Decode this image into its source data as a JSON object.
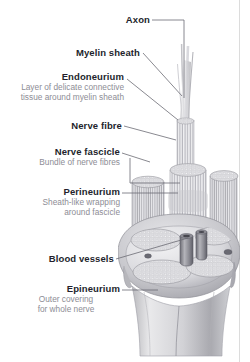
{
  "figure": {
    "kind": "anatomical-illustration",
    "style": "grayscale medical illustration"
  },
  "labels": [
    {
      "id": "axon",
      "title": "Axon",
      "sub": []
    },
    {
      "id": "myelin",
      "title": "Myelin sheath",
      "sub": []
    },
    {
      "id": "endoneurium",
      "title": "Endoneurium",
      "sub": [
        "Layer of delicate connective",
        "tissue around myelin sheath"
      ]
    },
    {
      "id": "nerve-fibre",
      "title": "Nerve fibre",
      "sub": []
    },
    {
      "id": "fascicle",
      "title": "Nerve fascicle",
      "sub": [
        "Bundle of nerve fibres"
      ]
    },
    {
      "id": "perineurium",
      "title": "Perineurium",
      "sub": [
        "Sheath-like wrapping",
        "around fascicle"
      ]
    },
    {
      "id": "blood",
      "title": "Blood vessels",
      "sub": []
    },
    {
      "id": "epineurium",
      "title": "Epineurium",
      "sub": [
        "Outer covering",
        "for whole nerve"
      ]
    }
  ],
  "footer": {
    "caption": ""
  },
  "colors": {
    "label_title": "#231f2c",
    "label_sub": "#8d8d95",
    "leader": "#6b6b74",
    "rule": "#dcdcdc",
    "background": "#ffffff",
    "tissue_light": "#efefef",
    "tissue_mid": "#cfcfd2",
    "tissue_dark": "#9a9aa0"
  }
}
